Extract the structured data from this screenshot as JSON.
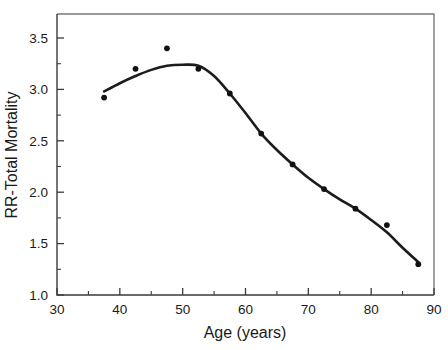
{
  "chart_data": {
    "type": "scatter",
    "title": "",
    "xlabel": "Age (years)",
    "ylabel": "RR-Total Mortality",
    "xlim": [
      30,
      90
    ],
    "ylim": [
      1.0,
      3.75
    ],
    "grid": false,
    "legend": "none",
    "x_ticks": [
      30,
      40,
      50,
      60,
      70,
      80,
      90
    ],
    "x_tick_labels": [
      "30",
      "40",
      "50",
      "60",
      "70",
      "80",
      "90"
    ],
    "x_minor_ticks": [
      35,
      45,
      55,
      65,
      75,
      85
    ],
    "y_ticks": [
      1.0,
      1.5,
      2.0,
      2.5,
      3.0,
      3.5
    ],
    "y_tick_labels": [
      "1.0",
      "1.5",
      "2.0",
      "2.5",
      "3.0",
      "3.5"
    ],
    "y_minor_ticks": [
      1.25,
      1.75,
      2.25,
      2.75,
      3.25,
      3.75
    ],
    "series": [
      {
        "name": "RR-Total Mortality observed",
        "marker": "filled-circle",
        "color": "#111111",
        "x": [
          37.5,
          42.5,
          47.5,
          52.5,
          57.5,
          62.5,
          67.5,
          72.5,
          77.5,
          82.5,
          87.5
        ],
        "values": [
          2.92,
          3.2,
          3.4,
          3.2,
          2.96,
          2.57,
          2.27,
          2.03,
          1.84,
          1.68,
          1.3
        ]
      },
      {
        "name": "Smoothed fit curve",
        "marker": "none",
        "color": "#1c1c1c",
        "x": [
          37.5,
          40.0,
          42.5,
          45.0,
          47.5,
          50.0,
          52.5,
          55.0,
          57.5,
          60.0,
          62.5,
          65.0,
          67.5,
          70.0,
          72.5,
          75.0,
          77.5,
          80.0,
          82.5,
          85.0,
          87.5
        ],
        "values": [
          2.98,
          3.06,
          3.13,
          3.19,
          3.23,
          3.24,
          3.23,
          3.13,
          2.96,
          2.77,
          2.57,
          2.41,
          2.27,
          2.14,
          2.03,
          1.93,
          1.84,
          1.73,
          1.61,
          1.46,
          1.32
        ]
      }
    ]
  },
  "axes": {
    "x_title": "Age (years)",
    "y_title": "RR-Total Mortality"
  },
  "colors": {
    "marker": "#111111",
    "curve": "#1c1c1c",
    "frame": "#7a7a7a",
    "axis": "#3a3a3a",
    "background": "#ffffff"
  }
}
